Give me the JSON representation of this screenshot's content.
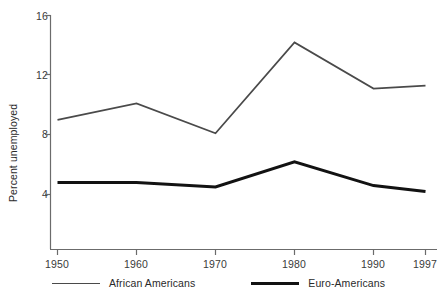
{
  "chart_data": {
    "type": "line",
    "title": "",
    "subtitle": "",
    "xlabel": "",
    "ylabel": "Percent unemployed",
    "categories": [
      "1950",
      "1960",
      "1970",
      "1980",
      "1990",
      "1997"
    ],
    "x": [
      1950,
      1960,
      1970,
      1980,
      1990,
      1997
    ],
    "xtick_labels": [
      "1950",
      "1960",
      "1970",
      "1980",
      "1990",
      "1997"
    ],
    "ytick_labels": [
      "4",
      "8",
      "12",
      "16"
    ],
    "yticks": [
      4,
      8,
      12,
      16
    ],
    "ylim": [
      0,
      17
    ],
    "xlim": [
      1948,
      1999
    ],
    "grid": false,
    "legend_position": "bottom",
    "series": [
      {
        "name": "African Americans",
        "color": "#4a4a4a",
        "width": 1.7,
        "values": [
          9.0,
          10.1,
          8.1,
          14.2,
          11.1,
          11.3
        ]
      },
      {
        "name": "Euro-Americans",
        "color": "#121212",
        "width": 3.0,
        "values": [
          4.8,
          4.8,
          4.5,
          6.2,
          4.6,
          4.2
        ]
      }
    ],
    "annotations": []
  },
  "legend": {
    "entries": [
      {
        "label": "African Americans"
      },
      {
        "label": "Euro-Americans"
      }
    ]
  },
  "axes": {
    "y_title": "Percent unemployed",
    "y_ticks": [
      {
        "label": "16"
      },
      {
        "label": "12"
      },
      {
        "label": "8"
      },
      {
        "label": "4"
      }
    ],
    "x_ticks": [
      {
        "label": "1950"
      },
      {
        "label": "1960"
      },
      {
        "label": "1970"
      },
      {
        "label": "1980"
      },
      {
        "label": "1990"
      },
      {
        "label": "1997"
      }
    ]
  }
}
